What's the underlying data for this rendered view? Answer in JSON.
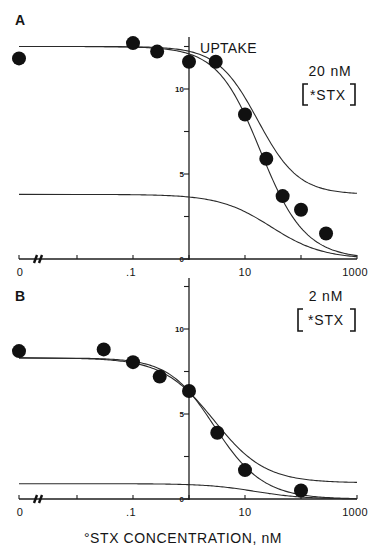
{
  "chart_data": [
    {
      "panel": "A",
      "type": "scatter",
      "title": "UPTAKE",
      "annotation": {
        "concentration": "20 nM",
        "species": "*STX",
        "species_bracketed": true
      },
      "xlabel": "°STX CONCENTRATION, nM",
      "ylabel": "",
      "x_scale": "log (with axis break between 0 and .01)",
      "x_tick_values": [
        0,
        0.01,
        0.1,
        1,
        10,
        100,
        1000
      ],
      "x_tick_labels": [
        "0",
        ".1",
        "10",
        "1000"
      ],
      "y_tick_values": [
        0,
        2.5,
        5,
        7.5,
        10,
        12.5
      ],
      "y_tick_labels": [
        "10",
        "5",
        "0"
      ],
      "ylim": [
        0,
        13
      ],
      "xlim": [
        0,
        1000
      ],
      "grid": false,
      "legend": null,
      "points": [
        [
          0,
          11.8
        ],
        [
          0.1,
          12.7
        ],
        [
          0.27,
          12.2
        ],
        [
          1,
          11.6
        ],
        [
          3,
          11.6
        ],
        [
          10,
          8.5
        ],
        [
          24,
          5.9
        ],
        [
          47,
          3.7
        ],
        [
          100,
          2.9
        ],
        [
          280,
          1.5
        ]
      ],
      "curves": [
        {
          "name": "total-fit",
          "offset": 0,
          "terms": [
            {
              "amp": 8.7,
              "ic50": 17,
              "hill": 1.2
            },
            {
              "amp": 3.8,
              "ic50": 29,
              "hill": 0.94
            }
          ]
        },
        {
          "name": "upper",
          "offset": 3.8,
          "terms": [
            {
              "amp": 8.7,
              "ic50": 17,
              "hill": 1.2
            }
          ]
        },
        {
          "name": "lower",
          "offset": 0,
          "terms": [
            {
              "amp": 3.8,
              "ic50": 29,
              "hill": 0.94
            }
          ]
        }
      ]
    },
    {
      "panel": "B",
      "type": "scatter",
      "title": "",
      "annotation": {
        "concentration": "2 nM",
        "species": "*STX",
        "species_bracketed": true
      },
      "xlabel": "°STX CONCENTRATION, nM",
      "ylabel": "",
      "x_scale": "log (with axis break between 0 and .01)",
      "x_tick_values": [
        0,
        0.01,
        0.1,
        1,
        10,
        100,
        1000
      ],
      "x_tick_labels": [
        "0",
        ".1",
        "10",
        "1000"
      ],
      "y_tick_values": [
        0,
        2.5,
        5,
        7.5,
        10,
        12.5
      ],
      "y_tick_labels": [
        "10",
        "5",
        "0"
      ],
      "ylim": [
        0,
        13
      ],
      "xlim": [
        0,
        1000
      ],
      "grid": false,
      "legend": null,
      "points": [
        [
          0,
          8.7
        ],
        [
          0.03,
          8.8
        ],
        [
          0.1,
          8.05
        ],
        [
          0.3,
          7.2
        ],
        [
          1,
          6.35
        ],
        [
          3.2,
          3.9
        ],
        [
          10,
          1.7
        ],
        [
          100,
          0.5
        ]
      ],
      "curves": [
        {
          "name": "total-fit",
          "offset": 0,
          "terms": [
            {
              "amp": 7.4,
              "ic50": 2.6,
              "hill": 1.1
            },
            {
              "amp": 0.9,
              "ic50": 15,
              "hill": 1.0
            }
          ]
        },
        {
          "name": "upper",
          "offset": 0.95,
          "terms": [
            {
              "amp": 7.35,
              "ic50": 2.8,
              "hill": 0.95
            }
          ]
        },
        {
          "name": "lower",
          "offset": 0,
          "terms": [
            {
              "amp": 0.9,
              "ic50": 15,
              "hill": 1.0
            }
          ]
        }
      ]
    }
  ]
}
